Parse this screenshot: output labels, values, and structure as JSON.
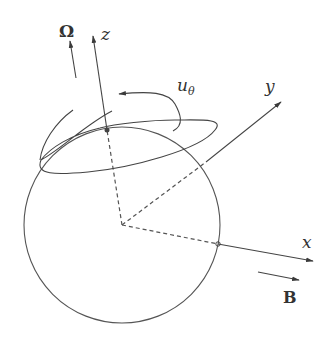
{
  "diagram": {
    "type": "rotating sphere with coordinate axes",
    "labels": {
      "omega": "Ω",
      "z": "z",
      "y": "y",
      "x": "x",
      "b_field": "B",
      "u_theta_main": "u",
      "u_theta_sub": "θ"
    },
    "colors": {
      "stroke": "#4a4a4a",
      "text": "#333333",
      "background": "#ffffff"
    }
  }
}
